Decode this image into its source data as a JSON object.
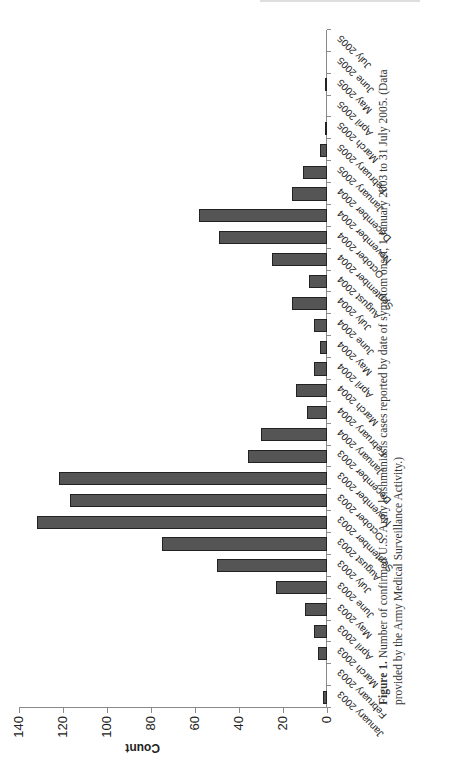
{
  "header": {
    "residual_text": ""
  },
  "chart_data": {
    "type": "bar",
    "orientation": "vertical bars, page rotated 90° counterclockwise",
    "title": "",
    "xlabel": "",
    "ylabel": "Count",
    "ylim": [
      0,
      140
    ],
    "yticks": [
      0,
      20,
      40,
      60,
      80,
      100,
      120,
      140
    ],
    "grid": false,
    "legend": null,
    "bar_color": "#555555",
    "categories": [
      "January 2003",
      "February 2003",
      "March 2003",
      "April 2003",
      "May 2003",
      "June 2003",
      "July 2003",
      "August 2003",
      "September 2003",
      "October 2003",
      "November 2003",
      "December 2003",
      "January 2004",
      "February 2004",
      "March 2004",
      "April 2004",
      "May 2004",
      "June 2004",
      "July 2004",
      "August 2004",
      "September 2004",
      "October 2004",
      "November 2004",
      "December 2004",
      "January 2005",
      "February 2005",
      "March 2005",
      "April 2005",
      "May 2005",
      "June 2005",
      "July 2005"
    ],
    "values": [
      2,
      0,
      4,
      6,
      10,
      23,
      50,
      75,
      132,
      117,
      122,
      36,
      30,
      9,
      14,
      6,
      3,
      6,
      16,
      8,
      25,
      49,
      58,
      16,
      11,
      3,
      1,
      0,
      1,
      0,
      0
    ]
  },
  "caption": {
    "label": "Figure 1.",
    "text": " Number of confirmed U.S. Army leishmaniasis cases reported by date of symptom onset, 1 January 2003 to 31 July 2005. (Data provided by the Army Medical Surveillance Activity.)"
  }
}
